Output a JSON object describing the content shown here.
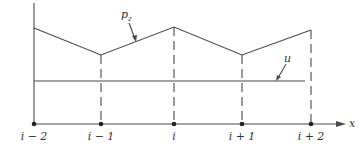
{
  "diagram": {
    "type": "piecewise-linear profile over grid nodes",
    "axis": {
      "label": "x"
    },
    "nodes": [
      {
        "label": "i − 2",
        "x": 34,
        "pz_y": 28
      },
      {
        "label": "i − 1",
        "x": 101,
        "pz_y": 55
      },
      {
        "label": "i",
        "x": 174,
        "pz_y": 27
      },
      {
        "label": "i + 1",
        "x": 242,
        "pz_y": 55
      },
      {
        "label": "i + 2",
        "x": 311,
        "pz_y": 30
      }
    ],
    "curves": {
      "pz": {
        "label_main": "p",
        "label_sub": "z"
      },
      "u": {
        "label": "u"
      }
    },
    "colors": {
      "ink": "#4a4a4a",
      "background": "#ffffff"
    }
  }
}
